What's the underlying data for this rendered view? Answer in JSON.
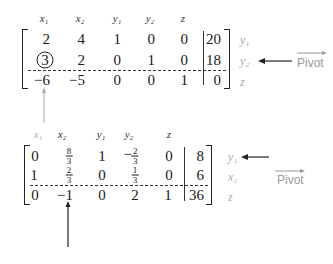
{
  "tableau1": {
    "headers": [
      "x₁",
      "x₂",
      "y₁",
      "y₂",
      "z"
    ],
    "rows": [
      {
        "cells": [
          "2",
          "4",
          "1",
          "0",
          "0"
        ],
        "rhs": "20",
        "label": "y₁"
      },
      {
        "cells": [
          "3",
          "2",
          "0",
          "1",
          "0"
        ],
        "rhs": "18",
        "label": "y₂"
      },
      {
        "cells": [
          "−6",
          "−5",
          "0",
          "0",
          "1"
        ],
        "rhs": "0",
        "label": "z"
      }
    ],
    "pivot_element": {
      "row": 1,
      "col": 0,
      "value": "3"
    },
    "pivot_label": "Pivot"
  },
  "tableau2": {
    "headers": [
      "x₁",
      "x₂",
      "y₁",
      "y₂",
      "z"
    ],
    "rows": [
      {
        "cells": [
          "0",
          "8/3",
          "1",
          "−2/3",
          "0"
        ],
        "rhs": "8",
        "label": "y₁"
      },
      {
        "cells": [
          "1",
          "2/3",
          "0",
          "1/3",
          "0"
        ],
        "rhs": "6",
        "label": "x₁"
      },
      {
        "cells": [
          "0",
          "−1",
          "0",
          "2",
          "1"
        ],
        "rhs": "36",
        "label": "z"
      }
    ],
    "pivot_label": "Pivot",
    "fractions": {
      "r0c1": {
        "num": "8",
        "den": "3"
      },
      "r1c1": {
        "num": "2",
        "den": "3"
      },
      "r0c3": {
        "sign": "−",
        "num": "2",
        "den": "3"
      },
      "r1c3": {
        "num": "1",
        "den": "3"
      }
    }
  }
}
